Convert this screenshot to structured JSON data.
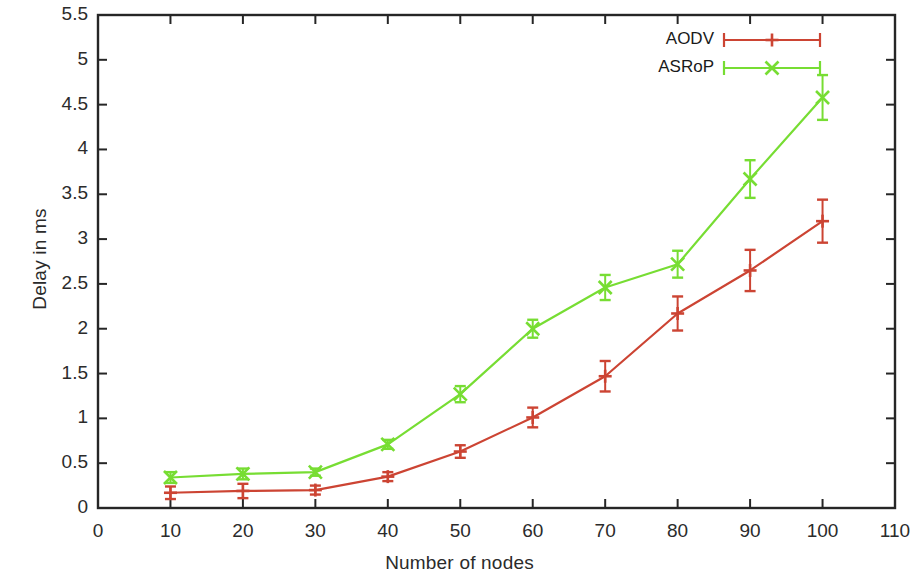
{
  "chart_data": {
    "type": "line",
    "title": "",
    "xlabel": "Number of nodes",
    "ylabel": "Delay in ms",
    "xlim": [
      0,
      110
    ],
    "ylim": [
      0,
      5.5
    ],
    "xticks": [
      0,
      10,
      20,
      30,
      40,
      50,
      60,
      70,
      80,
      90,
      100,
      110
    ],
    "xtick_labels": [
      "0",
      "10",
      "20",
      "30",
      "40",
      "50",
      "60",
      "70",
      "80",
      "90",
      "100",
      "110"
    ],
    "yticks": [
      0,
      0.5,
      1,
      1.5,
      2,
      2.5,
      3,
      3.5,
      4,
      4.5,
      5,
      5.5
    ],
    "ytick_labels": [
      "0",
      "0.5",
      "1",
      "1.5",
      "2",
      "2.5",
      "3",
      "3.5",
      "4",
      "4.5",
      "5",
      "5.5"
    ],
    "grid": false,
    "legend_position": "top-right",
    "x": [
      10,
      20,
      30,
      40,
      50,
      60,
      70,
      80,
      90,
      100
    ],
    "series": [
      {
        "name": "AODV",
        "color": "#cc4433",
        "marker": "plus",
        "values": [
          0.17,
          0.19,
          0.2,
          0.35,
          0.63,
          1.01,
          1.47,
          2.17,
          2.65,
          3.2
        ],
        "errors": [
          0.07,
          0.08,
          0.05,
          0.05,
          0.07,
          0.11,
          0.17,
          0.19,
          0.23,
          0.24
        ]
      },
      {
        "name": "ASRoP",
        "color": "#77dd33",
        "marker": "cross",
        "values": [
          0.34,
          0.38,
          0.4,
          0.71,
          1.27,
          2.0,
          2.46,
          2.72,
          3.67,
          4.58
        ],
        "errors": [
          0.06,
          0.06,
          0.04,
          0.05,
          0.09,
          0.1,
          0.14,
          0.15,
          0.21,
          0.25
        ]
      }
    ]
  },
  "legend": {
    "entries": [
      {
        "label": "AODV"
      },
      {
        "label": "ASRoP"
      }
    ]
  },
  "axes": {
    "x_title": "Number of nodes",
    "y_title": "Delay in ms"
  }
}
